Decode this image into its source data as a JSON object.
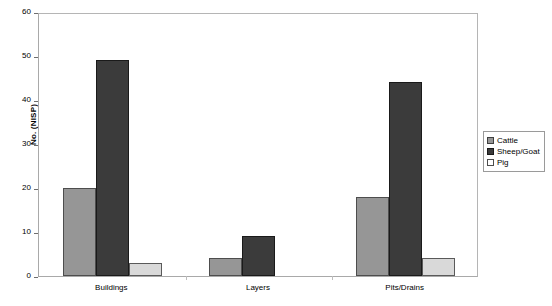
{
  "chart_data": {
    "type": "bar",
    "title": "",
    "xlabel": "",
    "ylabel": "No. (NISP)",
    "categories": [
      "Buildings",
      "Layers",
      "Pits/Drains"
    ],
    "series": [
      {
        "name": "Cattle",
        "values": [
          20,
          4,
          18
        ],
        "color": "#969696"
      },
      {
        "name": "Sheep/Goat",
        "values": [
          49,
          9,
          44
        ],
        "color": "#3b3b3b"
      },
      {
        "name": "Pig",
        "values": [
          3,
          0,
          4
        ],
        "color": "#d9d9d9"
      }
    ],
    "ylim": [
      0,
      60
    ],
    "yticks": [
      0,
      10,
      20,
      30,
      40,
      50,
      60
    ],
    "ytick_labels": [
      "0",
      "10",
      "20",
      "30",
      "40",
      "50",
      "60"
    ],
    "grid": false,
    "legend_position": "right",
    "plot_border": true
  },
  "axes": {
    "y_title": "No. (NISP)"
  },
  "legend": {
    "entries": [
      {
        "label": "Cattle"
      },
      {
        "label": "Sheep/Goat"
      },
      {
        "label": "Pig"
      }
    ]
  }
}
